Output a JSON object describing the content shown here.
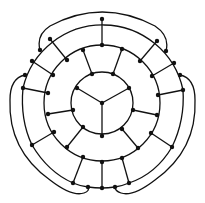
{
  "diagram": {
    "title": "",
    "colors": {
      "line": "#111111",
      "node": "#111111",
      "background": "#ffffff"
    },
    "center": [
      102,
      103
    ],
    "rings": [
      {
        "name": "inner",
        "r": 31
      },
      {
        "name": "middle",
        "r": 57
      }
    ],
    "nodes": [
      [
        102,
        103
      ],
      [
        77,
        88
      ],
      [
        92,
        74
      ],
      [
        113,
        74
      ],
      [
        129,
        88
      ],
      [
        133,
        110
      ],
      [
        122,
        129
      ],
      [
        102,
        136
      ],
      [
        83,
        127
      ],
      [
        73,
        110
      ],
      [
        102,
        45
      ],
      [
        83,
        50
      ],
      [
        122,
        49
      ],
      [
        67,
        60
      ],
      [
        140,
        61
      ],
      [
        53,
        75
      ],
      [
        152,
        76
      ],
      [
        48,
        93
      ],
      [
        158,
        95
      ],
      [
        48,
        114
      ],
      [
        157,
        115
      ],
      [
        54,
        132
      ],
      [
        151,
        133
      ],
      [
        67,
        147
      ],
      [
        138,
        148
      ],
      [
        83,
        157
      ],
      [
        122,
        158
      ],
      [
        102,
        162
      ],
      [
        102,
        19
      ],
      [
        50,
        39
      ],
      [
        157,
        41
      ],
      [
        40,
        50
      ],
      [
        166,
        51
      ],
      [
        32,
        61
      ],
      [
        174,
        63
      ],
      [
        25,
        75
      ],
      [
        180,
        75
      ],
      [
        23,
        88
      ],
      [
        183,
        90
      ],
      [
        32,
        145
      ],
      [
        172,
        147
      ],
      [
        73,
        183
      ],
      [
        129,
        183
      ],
      [
        88,
        187
      ],
      [
        115,
        187
      ],
      [
        102,
        188
      ]
    ],
    "edges": [
      [
        [
          102,
          103
        ],
        [
          77,
          88
        ]
      ],
      [
        [
          102,
          103
        ],
        [
          129,
          88
        ]
      ],
      [
        [
          102,
          103
        ],
        [
          102,
          136
        ]
      ],
      [
        [
          92,
          74
        ],
        [
          83,
          50
        ]
      ],
      [
        [
          113,
          74
        ],
        [
          122,
          49
        ]
      ],
      [
        [
          73,
          110
        ],
        [
          48,
          114
        ]
      ],
      [
        [
          133,
          110
        ],
        [
          157,
          115
        ]
      ],
      [
        [
          83,
          127
        ],
        [
          67,
          147
        ]
      ],
      [
        [
          122,
          129
        ],
        [
          138,
          148
        ]
      ],
      [
        [
          102,
          45
        ],
        [
          102,
          19
        ]
      ],
      [
        [
          67,
          60
        ],
        [
          50,
          39
        ]
      ],
      [
        [
          140,
          61
        ],
        [
          157,
          41
        ]
      ],
      [
        [
          53,
          75
        ],
        [
          32,
          61
        ]
      ],
      [
        [
          152,
          76
        ],
        [
          174,
          63
        ]
      ],
      [
        [
          48,
          93
        ],
        [
          23,
          88
        ]
      ],
      [
        [
          158,
          95
        ],
        [
          183,
          90
        ]
      ],
      [
        [
          54,
          132
        ],
        [
          32,
          145
        ]
      ],
      [
        [
          151,
          133
        ],
        [
          172,
          147
        ]
      ],
      [
        [
          83,
          157
        ],
        [
          73,
          183
        ]
      ],
      [
        [
          122,
          158
        ],
        [
          129,
          183
        ]
      ],
      [
        [
          102,
          162
        ],
        [
          102,
          188
        ]
      ]
    ]
  }
}
